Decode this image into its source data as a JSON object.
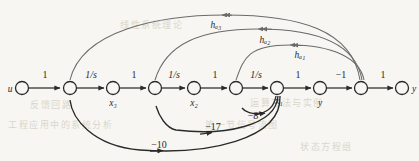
{
  "figure": {
    "type": "signal-flow-graph",
    "background_color": "#f7f6f2",
    "ink_color": "#2a2a2a",
    "arc_color": "#6b6b6b"
  },
  "nodes": [
    {
      "id": "u",
      "label": "u",
      "label_pos": "left",
      "cx": 22,
      "cy": 88
    },
    {
      "id": "n1",
      "label": "",
      "label_pos": "below",
      "cx": 70,
      "cy": 88
    },
    {
      "id": "x3",
      "label": "x₃",
      "label_pos": "below",
      "cx": 113,
      "cy": 88
    },
    {
      "id": "n2",
      "label": "",
      "label_pos": "below",
      "cx": 155,
      "cy": 88
    },
    {
      "id": "x2",
      "label": "x₂",
      "label_pos": "below",
      "cx": 194,
      "cy": 88
    },
    {
      "id": "n3",
      "label": "",
      "label_pos": "below",
      "cx": 236,
      "cy": 88
    },
    {
      "id": "x1",
      "label": "x₁",
      "label_pos": "below",
      "cx": 277,
      "cy": 88
    },
    {
      "id": "y1",
      "label": "y",
      "label_pos": "below",
      "cx": 320,
      "cy": 88
    },
    {
      "id": "n4",
      "label": "",
      "label_pos": "below",
      "cx": 361,
      "cy": 88
    },
    {
      "id": "y2",
      "label": "y",
      "label_pos": "right",
      "cx": 402,
      "cy": 88
    }
  ],
  "forward_edges": [
    {
      "from": "u",
      "to": "n1",
      "gain": "1"
    },
    {
      "from": "n1",
      "to": "x3",
      "gain": "1/s"
    },
    {
      "from": "x3",
      "to": "n2",
      "gain": "1"
    },
    {
      "from": "n2",
      "to": "x2",
      "gain": "1/s"
    },
    {
      "from": "x2",
      "to": "n3",
      "gain": "1"
    },
    {
      "from": "n3",
      "to": "x1",
      "gain": "1/s"
    },
    {
      "from": "x1",
      "to": "y1",
      "gain": "1"
    },
    {
      "from": "y1",
      "to": "n4",
      "gain": "−1"
    },
    {
      "from": "n4",
      "to": "y2",
      "gain": "1"
    }
  ],
  "feedback_upper": [
    {
      "from": "n4",
      "to": "n1",
      "gain": "hₐ₃"
    },
    {
      "from": "n4",
      "to": "n2",
      "gain": "hₐ₂"
    },
    {
      "from": "n4",
      "to": "n3",
      "gain": "hₐ₁"
    }
  ],
  "feedback_lower": [
    {
      "from": "x1",
      "to": "n3",
      "gain": "−8"
    },
    {
      "from": "x1",
      "to": "n2",
      "gain": "−17"
    },
    {
      "from": "x1",
      "to": "n1",
      "gain": "−10"
    }
  ],
  "bleed_through": {
    "line_a": "工程应用中的系统分析",
    "line_b": "第一节信号流图",
    "line_c": "运算方法与实例",
    "line_d": "状态方程组",
    "line_e": "线性系统理论",
    "line_f": "反馈回路"
  }
}
